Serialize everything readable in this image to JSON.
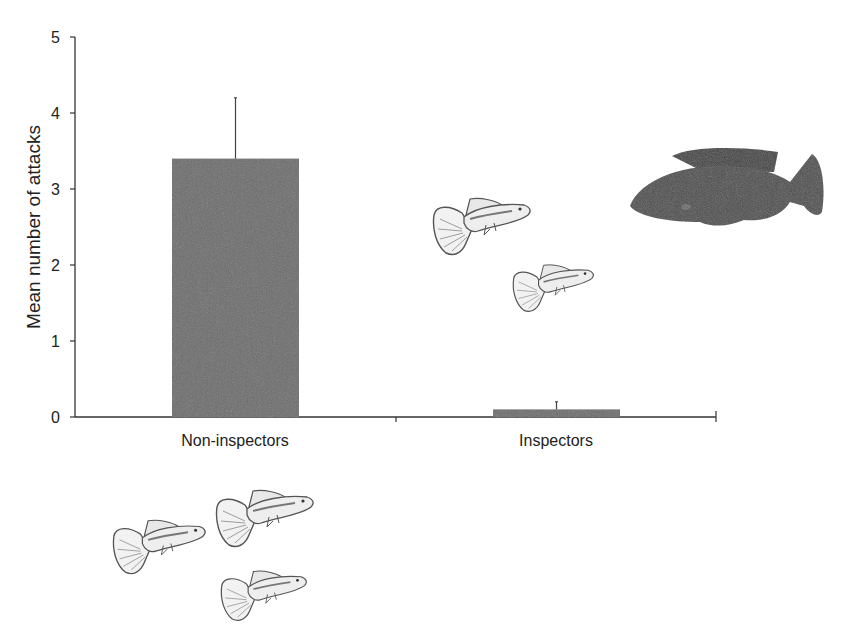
{
  "chart_data": {
    "type": "bar",
    "title": "",
    "xlabel": "",
    "ylabel": "Mean number of attacks",
    "ylim": [
      0,
      5
    ],
    "yticks": [
      0,
      1,
      2,
      3,
      4,
      5
    ],
    "categories": [
      "Non-inspectors",
      "Inspectors"
    ],
    "values": [
      3.4,
      0.1
    ],
    "error_upper": [
      4.2,
      0.2
    ],
    "error_bar_type": "upper only",
    "bar_color": "#6b6b6b",
    "grid": false,
    "legend": null,
    "annotations": [
      {
        "type": "illustration",
        "description": "predator fish (pike cichlid), dark silhouette",
        "position": "top-right"
      },
      {
        "type": "illustration",
        "description": "two guppies swimming toward predator",
        "position": "center-right above Inspectors"
      },
      {
        "type": "illustration",
        "description": "three guppies grouped",
        "position": "bottom-left below Non-inspectors"
      }
    ]
  },
  "colors": {
    "bar": "#6b6b6b",
    "axis": "#333333",
    "text": "#222222",
    "predator": "#4a4a4a",
    "guppy_stroke": "#555555",
    "guppy_fill": "#eeeeee"
  }
}
